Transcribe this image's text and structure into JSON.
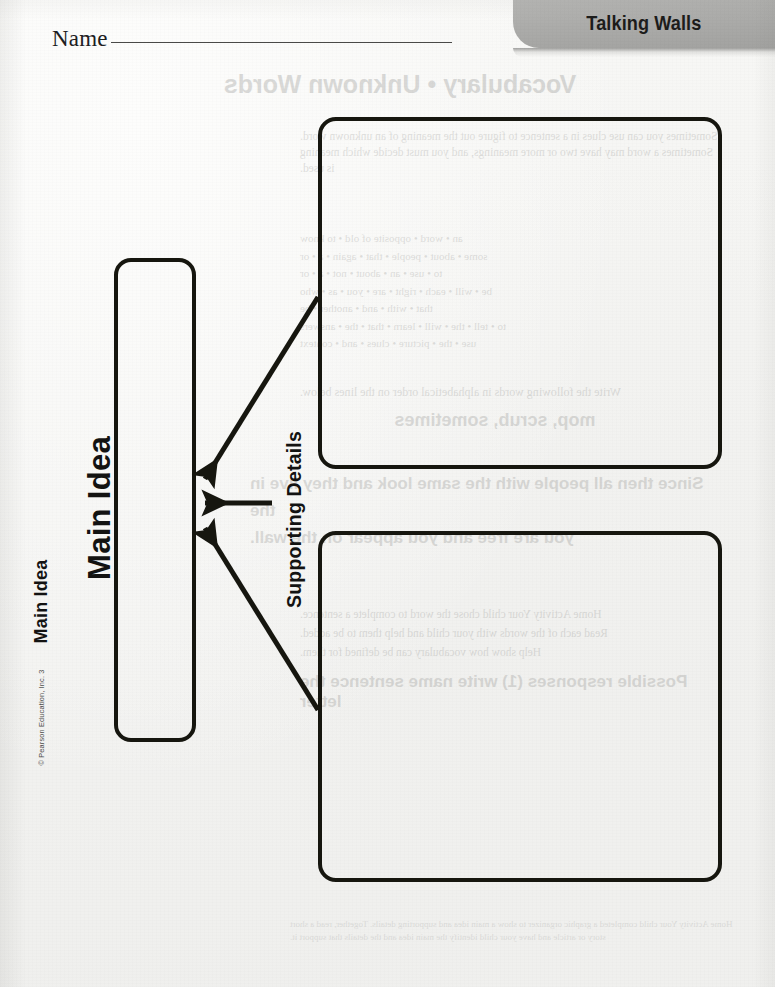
{
  "header": {
    "name_label": "Name",
    "title": "Talking Walls"
  },
  "organizer": {
    "main_idea_title": "Main Idea",
    "main_idea_box_label": "Main Idea",
    "supporting_details_label": "Supporting Details"
  },
  "footer": {
    "copyright": "© Pearson Education, Inc. 3"
  },
  "reverse_side_bleedthrough": {
    "title": "Vocabulary • Unknown Words",
    "intro": "Sometimes you can use clues in a sentence to figure out the meaning of an unknown word. Sometimes a word may have two or more meanings, and you must decide which meaning is used.",
    "list_a": "an • word • opposite of old • to know\nsome • about • people • that • again • a • or\nto • use • an • about • not • a • or\nbe • will • each • right • are • you • as • who\nthat • with • and • another • be\nto • tell • the • will • learn • that • the • answers\nuse • the • picture • clues • and • context",
    "question_1": "Write the following words in alphabetical order on the lines below.",
    "answer_1": "mop, scrub, sometimes",
    "question_2": "Since then all people with the same look and they live in the\nyou are free and you appear on the wall.",
    "list_b": "Home Activity Your child chose the word to complete a sentence.\nRead each of the words with your child and help them to be added.\nHelp show how vocabulary can be defined for them.",
    "question_3": "Possible responses (1) write name sentence the letter",
    "footer_note": "Home Activity Your child completed a graphic organizer to show a main idea and supporting details. Together, read a short story or article and have your child identify the main idea and the details that support it."
  }
}
